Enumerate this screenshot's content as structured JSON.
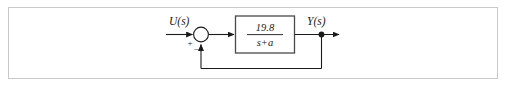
{
  "figure": {
    "kind": "control-system-block-diagram",
    "border_color": "#c9c9c9",
    "background": "#ffffff",
    "line_color": "#1a1a1a"
  },
  "diagram": {
    "input_label": "U(s)",
    "output_label": "Y(s)",
    "summing_junction": {
      "name": "summing-junction",
      "positive_sign": "+",
      "negative_sign": "–"
    },
    "transfer_function_block": {
      "numerator": "19.8",
      "denominator": "s+a"
    },
    "feedback": {
      "type": "unity-negative-feedback"
    }
  }
}
